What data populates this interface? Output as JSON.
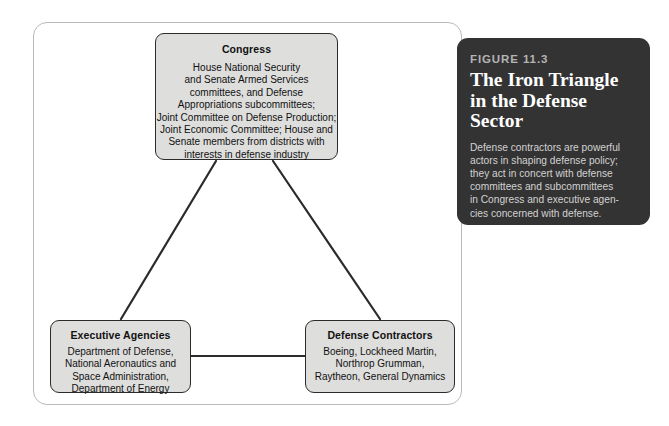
{
  "figure": {
    "label": "FIGURE 11.3",
    "title": "The Iron Triangle\nin the Defense\nSector",
    "caption": "Defense contractors are powerful\nactors in shaping defense policy;\nthey act in concert with defense\ncommittees and subcommittees\nin Congress and executive agen-\ncies concerned with defense.",
    "panel_background": "#333333",
    "panel_label_color": "#b4b4b4",
    "panel_title_color": "#ffffff",
    "panel_body_color": "#d2d2d2"
  },
  "diagram": {
    "frame_border_color": "#b9b9b9",
    "node_fill": "#dededd",
    "node_border_color": "#2b2b2b",
    "connector_color": "#2b2b2b",
    "nodes": [
      {
        "id": "congress",
        "title": "Congress",
        "body": "House National Security\nand Senate Armed Services\ncommittees, and Defense\nAppropriations subcommittees;\nJoint Committee on Defense Production;\nJoint Economic Committee; House and\nSenate members from districts with\ninterests in defense industry"
      },
      {
        "id": "executive-agencies",
        "title": "Executive Agencies",
        "body": "Department of Defense,\nNational Aeronautics and\nSpace Administration,\nDepartment of Energy"
      },
      {
        "id": "defense-contractors",
        "title": "Defense Contractors",
        "body": "Boeing, Lockheed Martin,\nNorthrop Grumman,\nRaytheon, General Dynamics"
      }
    ],
    "connectors": [
      {
        "from": "congress",
        "to": "executive-agencies"
      },
      {
        "from": "congress",
        "to": "defense-contractors"
      },
      {
        "from": "executive-agencies",
        "to": "defense-contractors"
      }
    ]
  }
}
